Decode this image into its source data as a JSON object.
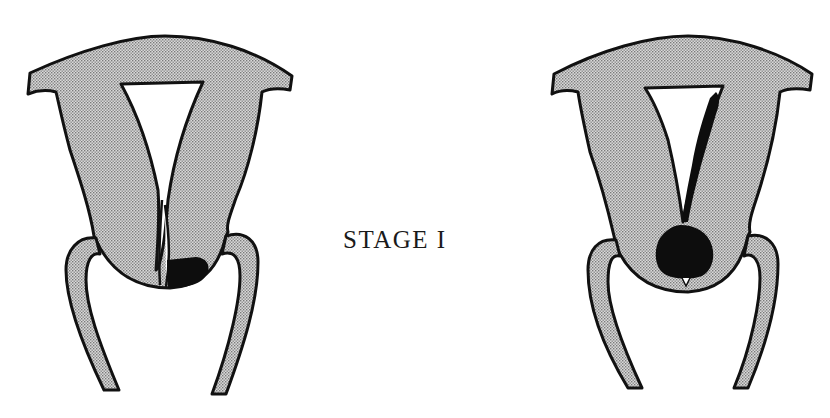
{
  "figure": {
    "caption": "STAGE I",
    "panels": [
      {
        "id": "left",
        "description": "Uterus cross-section with small dark lesion at cervix (right side)"
      },
      {
        "id": "right",
        "description": "Uterus cross-section with dark lesion extending from cervix up through endocervical canal into uterine cavity"
      }
    ]
  },
  "colors": {
    "tissue_fill": "#c9c9c9",
    "outline": "#111111",
    "lesion": "#0d0d0d",
    "background": "#ffffff"
  }
}
